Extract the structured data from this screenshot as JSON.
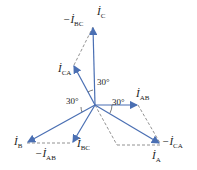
{
  "diagram": {
    "colors": {
      "phasor": "#4a6fb3",
      "dashed": "#666666",
      "text": "#222222"
    },
    "labels": {
      "ic": {
        "sym": "İ",
        "sub": "C",
        "prefix": ""
      },
      "neg_ibc": {
        "sym": "İ",
        "sub": "BC",
        "prefix": "−"
      },
      "ica": {
        "sym": "İ",
        "sub": "CA",
        "prefix": ""
      },
      "iab": {
        "sym": "İ",
        "sub": "AB",
        "prefix": ""
      },
      "neg_ica": {
        "sym": "İ",
        "sub": "CA",
        "prefix": "−"
      },
      "ia": {
        "sym": "İ",
        "sub": "A",
        "prefix": ""
      },
      "ib": {
        "sym": "İ",
        "sub": "B",
        "prefix": ""
      },
      "neg_iab": {
        "sym": "İ",
        "sub": "AB",
        "prefix": "−"
      },
      "ibc": {
        "sym": "İ",
        "sub": "BC",
        "prefix": ""
      }
    },
    "angles": [
      "30°",
      "30°",
      "30°"
    ]
  }
}
